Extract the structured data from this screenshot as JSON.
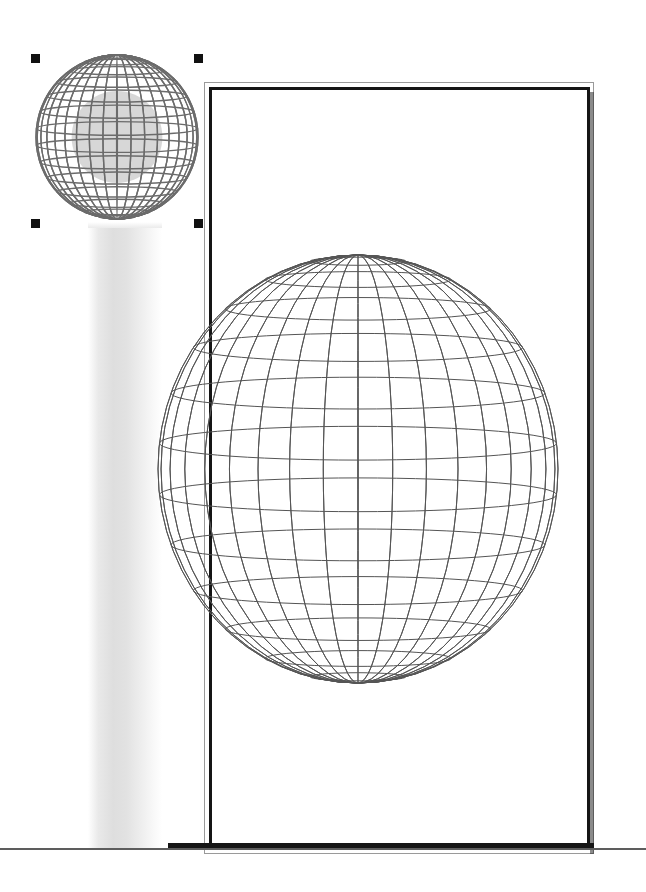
{
  "document": {
    "page_background": "#ffffff",
    "frame": {
      "outer_rule_color": "#9a9a9a",
      "inner_rule_color": "#151515",
      "shadow_color": "#2b2b2b",
      "bottom_rule_color": "#5d5d5d"
    },
    "gradient_band": {
      "name": "vertical-gradient-band",
      "start_color": "#ffffff",
      "mid_color": "#dedede",
      "end_color": "#ffffff"
    }
  },
  "objects": {
    "large_globe": {
      "label": "wireframe-globe-large",
      "center_x": 358,
      "center_y": 469,
      "radius_x": 200,
      "radius_y": 214,
      "meridians": 18,
      "parallels": 13,
      "stroke_color": "#555555",
      "fill": "none",
      "selected": false
    },
    "small_globe": {
      "label": "wireframe-globe-small",
      "center_x": 117,
      "center_y": 137,
      "radius_x": 81,
      "radius_y": 82,
      "meridians": 18,
      "parallels": 15,
      "stroke_color": "#6b6b6b",
      "fill": "#c9c9c9",
      "selected": true
    }
  },
  "selection": {
    "label": "selection-handles",
    "handle_color": "#111111",
    "handle_size": 9,
    "handles": [
      {
        "name": "top-left",
        "x": 31,
        "y": 54
      },
      {
        "name": "top-right",
        "x": 194,
        "y": 54
      },
      {
        "name": "bottom-left",
        "x": 31,
        "y": 219
      },
      {
        "name": "bottom-right",
        "x": 194,
        "y": 219
      }
    ]
  }
}
